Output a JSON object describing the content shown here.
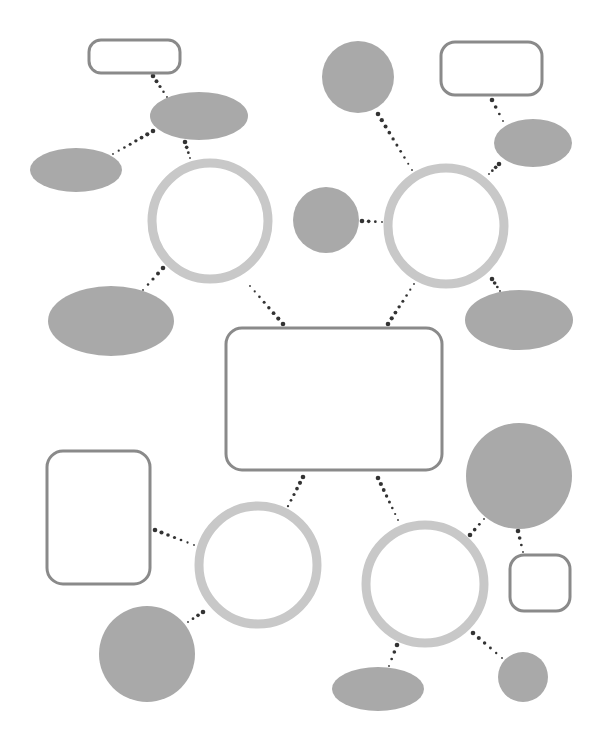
{
  "diagram": {
    "type": "blank-bubble-map-worksheet",
    "colors": {
      "background": "#ffffff",
      "ring": "#c8c8c8",
      "filled_shape": "#a9a9a9",
      "outline_box": "#8a8a8a",
      "connector_dot": "#333333"
    },
    "central_box": {
      "id": "center",
      "shape": "rounded-rect",
      "x": 226,
      "y": 328,
      "w": 216,
      "h": 142,
      "r": 16
    },
    "hubs": [
      {
        "id": "hub-top-left",
        "cx": 210,
        "cy": 221,
        "r": 58
      },
      {
        "id": "hub-top-right",
        "cx": 446,
        "cy": 226,
        "r": 58
      },
      {
        "id": "hub-bottom-left",
        "cx": 258,
        "cy": 565,
        "r": 59
      },
      {
        "id": "hub-bottom-right",
        "cx": 425,
        "cy": 584,
        "r": 59
      }
    ],
    "satellites": [
      {
        "id": "tl-box",
        "parent": "tl-ellipse",
        "shape": "rounded-rect",
        "x": 89,
        "y": 40,
        "w": 91,
        "h": 33,
        "r": 12
      },
      {
        "id": "tl-ellipse",
        "parent": "hub-top-left",
        "shape": "ellipse",
        "cx": 199,
        "cy": 116,
        "rx": 49,
        "ry": 24
      },
      {
        "id": "tl-left-ellipse",
        "parent": "tl-ellipse",
        "shape": "ellipse",
        "cx": 76,
        "cy": 170,
        "rx": 46,
        "ry": 22
      },
      {
        "id": "tl-bottom-ellipse",
        "parent": "hub-top-left",
        "shape": "ellipse",
        "cx": 111,
        "cy": 321,
        "rx": 63,
        "ry": 35
      },
      {
        "id": "tr-top-circle",
        "parent": "hub-top-right",
        "shape": "circle",
        "cx": 358,
        "cy": 77,
        "r": 36
      },
      {
        "id": "tr-mid-circle",
        "parent": "hub-top-right",
        "shape": "circle",
        "cx": 326,
        "cy": 220,
        "r": 33
      },
      {
        "id": "tr-box",
        "parent": "tr-ellipse",
        "shape": "rounded-rect",
        "x": 441,
        "y": 42,
        "w": 101,
        "h": 53,
        "r": 14
      },
      {
        "id": "tr-ellipse",
        "parent": "hub-top-right",
        "shape": "ellipse",
        "cx": 533,
        "cy": 143,
        "rx": 39,
        "ry": 24
      },
      {
        "id": "tr-bottom-ellipse",
        "parent": "hub-top-right",
        "shape": "ellipse",
        "cx": 519,
        "cy": 320,
        "rx": 54,
        "ry": 30
      },
      {
        "id": "bl-box",
        "parent": "hub-bottom-left",
        "shape": "rounded-rect",
        "x": 47,
        "y": 451,
        "w": 103,
        "h": 133,
        "r": 16
      },
      {
        "id": "bl-circle",
        "parent": "hub-bottom-left",
        "shape": "circle",
        "cx": 147,
        "cy": 654,
        "r": 48
      },
      {
        "id": "br-top-circle",
        "parent": "hub-bottom-right",
        "shape": "circle",
        "cx": 519,
        "cy": 476,
        "r": 53
      },
      {
        "id": "br-box",
        "parent": "br-top-circle",
        "shape": "rounded-rect",
        "x": 510,
        "y": 555,
        "w": 60,
        "h": 56,
        "r": 14
      },
      {
        "id": "br-ellipse",
        "parent": "hub-bottom-right",
        "shape": "ellipse",
        "cx": 378,
        "cy": 689,
        "rx": 46,
        "ry": 22
      },
      {
        "id": "br-small-circle",
        "parent": "hub-bottom-right",
        "shape": "circle",
        "cx": 523,
        "cy": 677,
        "r": 25
      }
    ],
    "connectors": [
      {
        "from": "center",
        "to": "hub-top-left",
        "x1": 283,
        "y1": 324,
        "x2": 250,
        "y2": 286
      },
      {
        "from": "center",
        "to": "hub-top-right",
        "x1": 388,
        "y1": 324,
        "x2": 414,
        "y2": 284
      },
      {
        "from": "center",
        "to": "hub-bottom-left",
        "x1": 303,
        "y1": 477,
        "x2": 285,
        "y2": 512
      },
      {
        "from": "center",
        "to": "hub-bottom-right",
        "x1": 378,
        "y1": 478,
        "x2": 398,
        "y2": 520
      },
      {
        "from": "tl-box",
        "to": "tl-ellipse",
        "x1": 153,
        "y1": 76,
        "x2": 167,
        "y2": 97
      },
      {
        "from": "tl-ellipse",
        "to": "tl-left-ellipse",
        "x1": 153,
        "y1": 131,
        "x2": 113,
        "y2": 154
      },
      {
        "from": "tl-ellipse",
        "to": "hub-top-left",
        "x1": 185,
        "y1": 142,
        "x2": 190,
        "y2": 158
      },
      {
        "from": "hub-top-left",
        "to": "tl-bottom-ellipse",
        "x1": 163,
        "y1": 268,
        "x2": 143,
        "y2": 290
      },
      {
        "from": "tr-top-circle",
        "to": "hub-top-right",
        "x1": 378,
        "y1": 114,
        "x2": 412,
        "y2": 170
      },
      {
        "from": "tr-mid-circle",
        "to": "hub-top-right",
        "x1": 362,
        "y1": 221,
        "x2": 382,
        "y2": 222
      },
      {
        "from": "tr-box",
        "to": "tr-ellipse",
        "x1": 492,
        "y1": 100,
        "x2": 503,
        "y2": 121
      },
      {
        "from": "tr-ellipse",
        "to": "hub-top-right",
        "x1": 499,
        "y1": 164,
        "x2": 489,
        "y2": 174
      },
      {
        "from": "hub-top-right",
        "to": "tr-bottom-ellipse",
        "x1": 492,
        "y1": 279,
        "x2": 500,
        "y2": 291
      },
      {
        "from": "bl-box",
        "to": "hub-bottom-left",
        "x1": 155,
        "y1": 530,
        "x2": 194,
        "y2": 545
      },
      {
        "from": "hub-bottom-left",
        "to": "bl-circle",
        "x1": 203,
        "y1": 612,
        "x2": 188,
        "y2": 622
      },
      {
        "from": "hub-bottom-right",
        "to": "br-top-circle",
        "x1": 470,
        "y1": 535,
        "x2": 484,
        "y2": 519
      },
      {
        "from": "br-top-circle",
        "to": "br-box",
        "x1": 518,
        "y1": 531,
        "x2": 523,
        "y2": 552
      },
      {
        "from": "hub-bottom-right",
        "to": "br-ellipse",
        "x1": 397,
        "y1": 645,
        "x2": 389,
        "y2": 666
      },
      {
        "from": "hub-bottom-right",
        "to": "br-small-circle",
        "x1": 473,
        "y1": 633,
        "x2": 502,
        "y2": 658
      }
    ],
    "text_labels": []
  }
}
